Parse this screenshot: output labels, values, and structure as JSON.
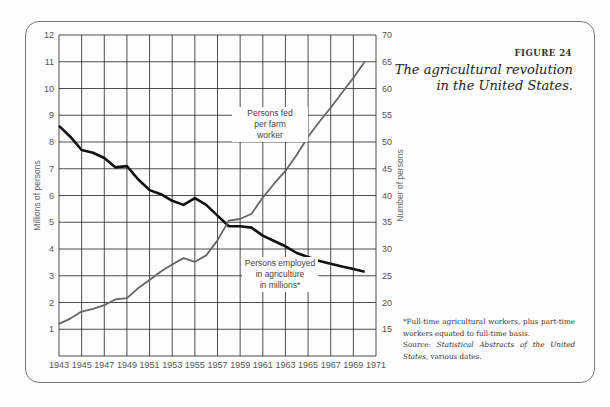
{
  "figure": {
    "number": "FIGURE 24",
    "title_line1": "The agricultural revolution",
    "title_line2": "in the United States."
  },
  "footnote": {
    "note": "*Full-time agricultural workers, plus part-time workers equated to full-time basis.",
    "source_prefix": "Source: ",
    "source_italic": "Statistical Abstracts of the United States",
    "source_suffix": ", various dates."
  },
  "colors": {
    "employed_line": "#111111",
    "fed_line": "#666666",
    "grid": "#222222"
  },
  "chart_data": {
    "type": "line",
    "title": "The agricultural revolution in the United States.",
    "xlabel": "",
    "ylabel": "Millions of persons",
    "ylabel_right": "Number of persons",
    "ylim": [
      0,
      12
    ],
    "ylim_right": [
      10,
      70
    ],
    "xlim": [
      1943,
      1971
    ],
    "grid": true,
    "x_ticks": [
      "1943",
      "1945",
      "1947",
      "1949",
      "1951",
      "1953",
      "1955",
      "1957",
      "1959",
      "1961",
      "1963",
      "1965",
      "1967",
      "1969",
      "1971"
    ],
    "y_ticks_left": [
      "1",
      "2",
      "3",
      "4",
      "5",
      "6",
      "7",
      "8",
      "9",
      "10",
      "11",
      "12"
    ],
    "y_ticks_right": [
      "15",
      "20",
      "25",
      "30",
      "35",
      "40",
      "45",
      "50",
      "55",
      "60",
      "65",
      "70"
    ],
    "series": [
      {
        "name": "Persons employed in agriculture in millions*",
        "axis": "left",
        "x": [
          1943,
          1944,
          1945,
          1946,
          1947,
          1948,
          1949,
          1950,
          1951,
          1952,
          1953,
          1954,
          1955,
          1956,
          1957,
          1958,
          1959,
          1960,
          1961,
          1962,
          1963,
          1964,
          1965,
          1966,
          1967,
          1968,
          1969,
          1970
        ],
        "values": [
          8.6,
          8.2,
          7.7,
          7.6,
          7.4,
          7.05,
          7.1,
          6.6,
          6.2,
          6.05,
          5.8,
          5.65,
          5.9,
          5.65,
          5.25,
          4.85,
          4.85,
          4.8,
          4.5,
          4.3,
          4.1,
          3.85,
          3.7,
          3.55,
          3.45,
          3.35,
          3.25,
          3.15
        ]
      },
      {
        "name": "Persons fed per farm worker",
        "axis": "right",
        "x": [
          1943,
          1944,
          1945,
          1946,
          1947,
          1948,
          1949,
          1950,
          1951,
          1952,
          1953,
          1954,
          1955,
          1956,
          1957,
          1958,
          1959,
          1960,
          1961,
          1962,
          1963,
          1964,
          1965,
          1966,
          1967,
          1968,
          1969,
          1970
        ],
        "values": [
          16,
          17,
          18.3,
          18.8,
          19.5,
          20.6,
          20.8,
          22.7,
          24.2,
          25.8,
          27.1,
          28.3,
          27.6,
          28.8,
          31.6,
          35.3,
          35.6,
          36.6,
          39.6,
          42.2,
          44.6,
          47.6,
          51,
          53.8,
          56.4,
          59.2,
          62,
          65
        ]
      }
    ],
    "annotations": [
      {
        "text": "Persons fed per farm worker",
        "lines": [
          "Persons fed",
          "per farm",
          "worker"
        ]
      },
      {
        "text": "Persons employed in agriculture in millions*",
        "lines": [
          "Persons employed",
          "in agriculture",
          "in millions*"
        ]
      }
    ]
  }
}
